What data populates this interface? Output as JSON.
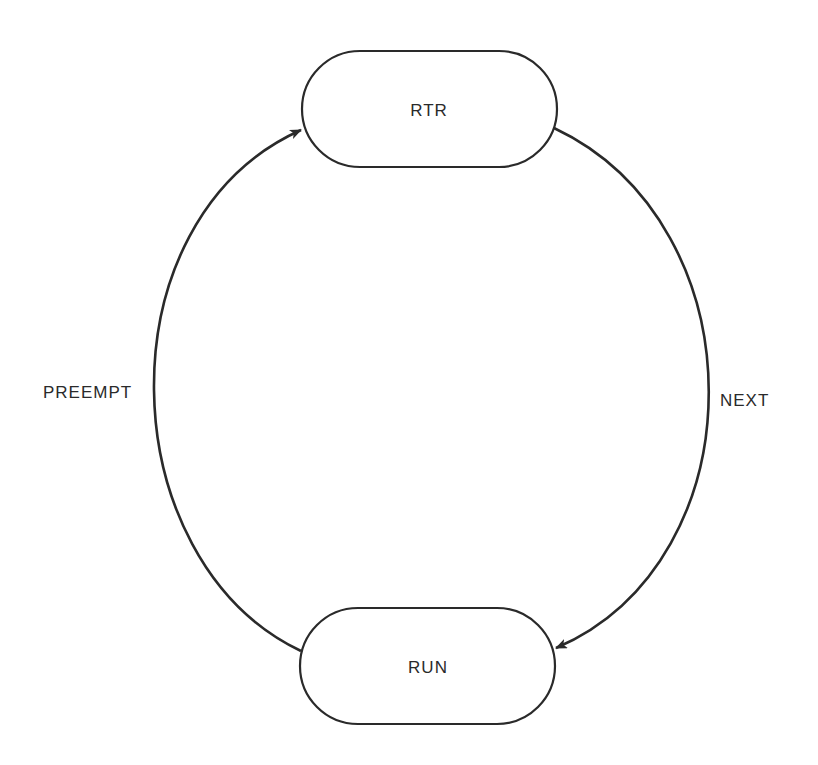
{
  "diagram": {
    "type": "state-transition",
    "stroke_color": "#2a2a2a",
    "background": "#ffffff",
    "nodes": [
      {
        "id": "rtr",
        "label": "RTR"
      },
      {
        "id": "run",
        "label": "RUN"
      }
    ],
    "edges": [
      {
        "id": "preempt",
        "from": "run",
        "to": "rtr",
        "label": "PREEMPT"
      },
      {
        "id": "next",
        "from": "rtr",
        "to": "run",
        "label": "NEXT"
      }
    ]
  }
}
